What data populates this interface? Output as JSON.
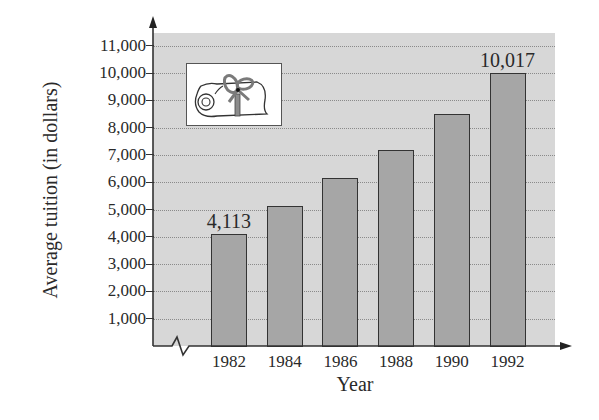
{
  "chart_data": {
    "type": "bar",
    "title": "",
    "xlabel": "Year",
    "ylabel": "Average tuition (in dollars)",
    "categories": [
      "1982",
      "1984",
      "1986",
      "1988",
      "1990",
      "1992"
    ],
    "values": [
      4113,
      5130,
      6150,
      7180,
      8500,
      10017
    ],
    "data_labels": [
      {
        "category": "1982",
        "text": "4,113"
      },
      {
        "category": "1992",
        "text": "10,017"
      }
    ],
    "yticks": [
      1000,
      2000,
      3000,
      4000,
      5000,
      6000,
      7000,
      8000,
      9000,
      10000,
      11000
    ],
    "ytick_labels": [
      "1,000",
      "2,000",
      "3,000",
      "4,000",
      "5,000",
      "6,000",
      "7,000",
      "8,000",
      "9,000",
      "10,000",
      "11,000"
    ],
    "ylim": [
      0,
      11500
    ],
    "grid": true,
    "grid_style": "dotted horizontal",
    "axis_break": "x-axis break near origin",
    "legend": null,
    "decoration": "diploma scroll icon in upper-left of plot area"
  },
  "colors": {
    "plot_background": "#d7d7d7",
    "bar_fill": "#a6a6a6",
    "bar_border": "#333333",
    "text": "#2a2a2a"
  }
}
